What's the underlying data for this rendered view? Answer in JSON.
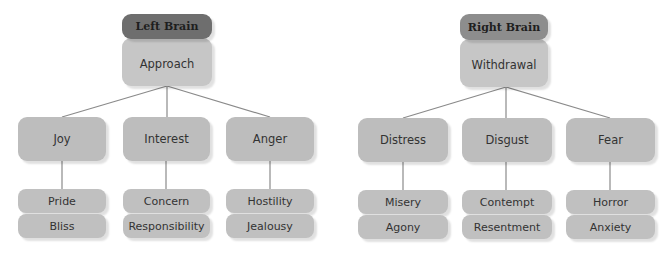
{
  "left": {
    "header": "Left Brain",
    "root": "Approach",
    "children": [
      {
        "label": "Joy",
        "leaves": [
          "Pride",
          "Bliss"
        ]
      },
      {
        "label": "Interest",
        "leaves": [
          "Concern",
          "Responsibility"
        ]
      },
      {
        "label": "Anger",
        "leaves": [
          "Hostility",
          "Jealousy"
        ]
      }
    ]
  },
  "right": {
    "header": "Right Brain",
    "root": "Withdrawal",
    "children": [
      {
        "label": "Distress",
        "leaves": [
          "Misery",
          "Agony"
        ]
      },
      {
        "label": "Disgust",
        "leaves": [
          "Contempt",
          "Resentment"
        ]
      },
      {
        "label": "Fear",
        "leaves": [
          "Horror",
          "Anxiety"
        ]
      }
    ]
  },
  "colors": {
    "left_header": "#6e6e6e",
    "right_header": "#8d8d8d",
    "root": "#c6c6c6",
    "mid": "#bdbdbd",
    "leaf": "#c0c0c0",
    "connector": "#8a8a8a"
  }
}
